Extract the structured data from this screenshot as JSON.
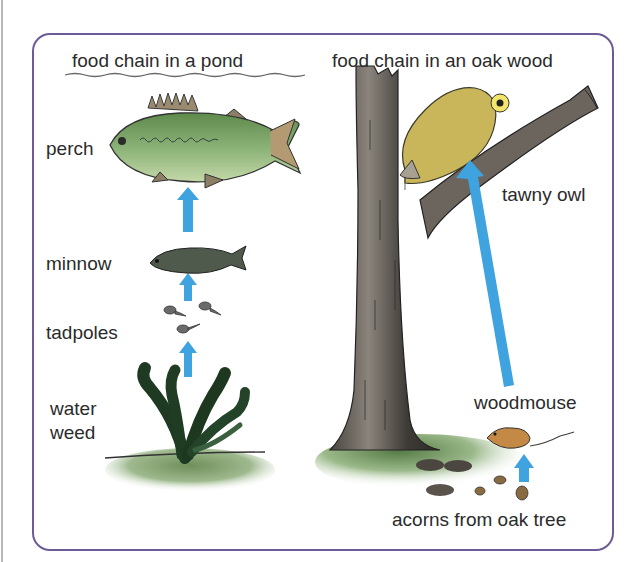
{
  "pond": {
    "title": "food chain in a pond",
    "organisms": [
      {
        "label": "perch"
      },
      {
        "label": "minnow"
      },
      {
        "label": "tadpoles"
      },
      {
        "label_line1": "water",
        "label_line2": "weed"
      }
    ]
  },
  "oak_wood": {
    "title": "food chain in an oak wood",
    "organisms": [
      {
        "label": "tawny owl"
      },
      {
        "label": "woodmouse"
      },
      {
        "label": "acorns from oak tree"
      }
    ]
  },
  "colors": {
    "frame": "#6e5a96",
    "arrow": "#3fa3e0",
    "fish_green": "#7fa467",
    "trunk": "#5a5550",
    "owl": "#c9b55a",
    "mouse": "#c48a45"
  }
}
